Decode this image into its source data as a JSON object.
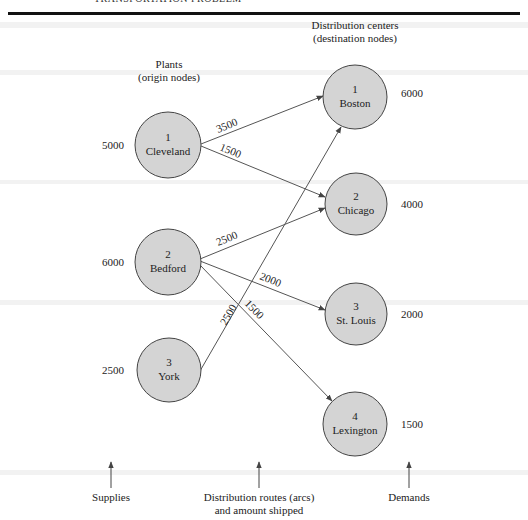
{
  "header": {
    "title": "TRANSPORTATION PROBLEM"
  },
  "titles": {
    "origin_line1": "Plants",
    "origin_line2": "(origin nodes)",
    "dest_line1": "Distribution centers",
    "dest_line2": "(destination nodes)"
  },
  "origins": [
    {
      "id": "1",
      "name": "Cleveland",
      "supply": "5000",
      "cx": 168,
      "cy": 145
    },
    {
      "id": "2",
      "name": "Bedford",
      "supply": "6000",
      "cx": 168,
      "cy": 262
    },
    {
      "id": "3",
      "name": "York",
      "supply": "2500",
      "cx": 169,
      "cy": 370
    }
  ],
  "destinations": [
    {
      "id": "1",
      "name": "Boston",
      "demand": "6000",
      "cx": 355,
      "cy": 97
    },
    {
      "id": "2",
      "name": "Chicago",
      "demand": "4000",
      "cx": 356,
      "cy": 204
    },
    {
      "id": "3",
      "name": "St. Louis",
      "demand": "2000",
      "cx": 356,
      "cy": 314
    },
    {
      "id": "4",
      "name": "Lexington",
      "demand": "1500",
      "cx": 355,
      "cy": 424
    }
  ],
  "routes": [
    {
      "from": "Cleveland",
      "to": "Boston",
      "amount": "3500"
    },
    {
      "from": "Cleveland",
      "to": "Chicago",
      "amount": "1500"
    },
    {
      "from": "Bedford",
      "to": "Chicago",
      "amount": "2500"
    },
    {
      "from": "Bedford",
      "to": "St. Louis",
      "amount": "2000"
    },
    {
      "from": "Bedford",
      "to": "Lexington",
      "amount": "1500"
    },
    {
      "from": "York",
      "to": "Boston",
      "amount": "2500"
    }
  ],
  "footer": {
    "supplies": "Supplies",
    "routes_line1": "Distribution routes (arcs)",
    "routes_line2": "and amount shipped",
    "demands": "Demands"
  },
  "colors": {
    "node_fill": "#d4d4d4",
    "stroke": "#444444",
    "rule": "#111111"
  }
}
